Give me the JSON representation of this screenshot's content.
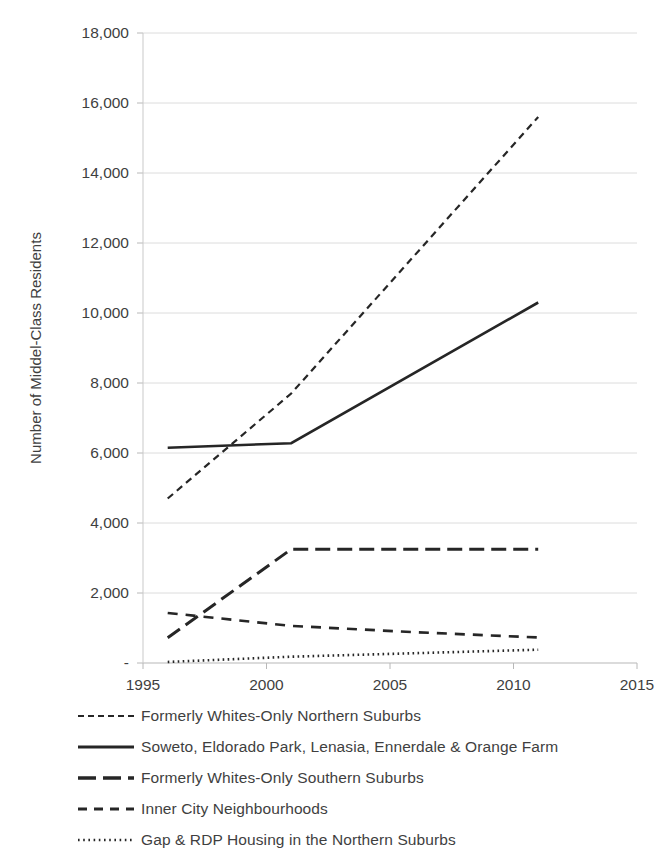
{
  "chart_data": {
    "type": "line",
    "title": "",
    "xlabel": "",
    "ylabel": "Number of Middel-Class Residents",
    "xlim": [
      1995,
      2015
    ],
    "ylim": [
      0,
      18000
    ],
    "grid": true,
    "legend_position": "bottom-left",
    "x_tick_labels": [
      "1995",
      "2000",
      "2005",
      "2010",
      "2015"
    ],
    "x_ticks": [
      1995,
      2000,
      2005,
      2010,
      2015
    ],
    "y_tick_labels": [
      "-",
      "2,000",
      "4,000",
      "6,000",
      "8,000",
      "10,000",
      "12,000",
      "14,000",
      "16,000",
      "18,000"
    ],
    "y_ticks": [
      0,
      2000,
      4000,
      6000,
      8000,
      10000,
      12000,
      14000,
      16000,
      18000
    ],
    "series": [
      {
        "name": "Formerly Whites-Only Northern Suburbs",
        "style": "dashed",
        "dasharray": "7,5",
        "width": 2.2,
        "color": "#262626",
        "x": [
          1996,
          2001,
          2011
        ],
        "values": [
          4700,
          7700,
          15600
        ]
      },
      {
        "name": "Soweto, Eldorado Park, Lenasia, Ennerdale & Orange Farm",
        "style": "solid",
        "dasharray": "none",
        "width": 2.6,
        "color": "#262626",
        "x": [
          1996,
          2001,
          2011
        ],
        "values": [
          6150,
          6280,
          10300
        ]
      },
      {
        "name": "Formerly Whites-Only Southern Suburbs",
        "style": "long-dash",
        "dasharray": "15,7",
        "width": 3.0,
        "color": "#262626",
        "x": [
          1996,
          2001,
          2011
        ],
        "values": [
          720,
          3250,
          3250
        ]
      },
      {
        "name": "Inner City Neighbourhoods",
        "style": "medium-dash",
        "dasharray": "10,8",
        "width": 2.6,
        "color": "#262626",
        "x": [
          1996,
          2001,
          2006,
          2011
        ],
        "values": [
          1430,
          1060,
          880,
          730
        ]
      },
      {
        "name": "Gap & RDP Housing in the Northern Suburbs",
        "style": "dotted",
        "dasharray": "1.6,3.4",
        "width": 2.6,
        "color": "#262626",
        "x": [
          1996,
          2001,
          2011
        ],
        "values": [
          30,
          180,
          380
        ]
      }
    ]
  },
  "legend": {
    "items": [
      {
        "label": "Formerly Whites-Only Northern Suburbs",
        "dasharray": "6,4",
        "width": 2.2
      },
      {
        "label": "Soweto, Eldorado Park, Lenasia, Ennerdale & Orange Farm",
        "dasharray": "none",
        "width": 3.0
      },
      {
        "label": "Formerly Whites-Only Southern Suburbs",
        "dasharray": "18,7",
        "width": 3.4
      },
      {
        "label": "Inner City Neighbourhoods",
        "dasharray": "9,7",
        "width": 3.0
      },
      {
        "label": "Gap & RDP Housing in the Northern Suburbs",
        "dasharray": "1.6,3.6",
        "width": 2.6
      }
    ]
  }
}
